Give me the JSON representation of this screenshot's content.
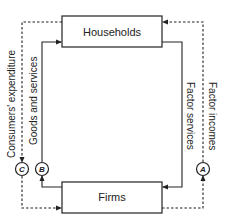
{
  "diagram": {
    "boxes": {
      "top": {
        "label": "Households"
      },
      "bottom": {
        "label": "Firms"
      }
    },
    "flows": [
      {
        "id": "consumers-expenditure",
        "label": "Consumers' expenditure",
        "style": "dashed",
        "node": "C"
      },
      {
        "id": "goods-and-services",
        "label": "Goods and services",
        "style": "solid",
        "node": "B"
      },
      {
        "id": "factor-services",
        "label": "Factor services",
        "style": "solid"
      },
      {
        "id": "factor-incomes",
        "label": "Factor incomes",
        "style": "dashed",
        "node": "A"
      }
    ],
    "nodes": {
      "A": "A",
      "B": "B",
      "C": "C"
    },
    "colors": {
      "line": "#222222",
      "background": "#ffffff"
    }
  }
}
